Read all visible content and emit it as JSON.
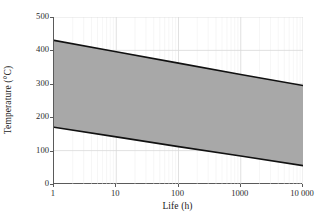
{
  "chart_data": {
    "type": "area",
    "title": "",
    "xlabel": "Life (h)",
    "ylabel": "Temperature (°C)",
    "xscale": "log",
    "xlim": [
      1,
      10000
    ],
    "ylim": [
      0,
      500
    ],
    "xticks": [
      1,
      10,
      100,
      1000,
      10000
    ],
    "xticklabels": [
      "1",
      "10",
      "100",
      "1000",
      "10 000"
    ],
    "yticks": [
      0,
      100,
      200,
      300,
      400,
      500
    ],
    "yticklabels": [
      "0",
      "100",
      "200",
      "300",
      "400",
      "500"
    ],
    "grid": true,
    "grid_color": "#d9d9d9",
    "legend": null,
    "band_fill_color": "#a8a8a8",
    "band_line_color": "#111111",
    "series": [
      {
        "name": "Upper bound",
        "x": [
          1,
          10,
          100,
          1000,
          10000
        ],
        "values": [
          430,
          396,
          362,
          328,
          295
        ]
      },
      {
        "name": "Lower bound",
        "x": [
          1,
          10,
          100,
          1000,
          10000
        ],
        "values": [
          170,
          141,
          112,
          84,
          55
        ]
      }
    ]
  },
  "axes": {
    "y_title": "Temperature (°C)",
    "x_title": "Life (h)"
  },
  "xticklabels": [
    "1",
    "10",
    "100",
    "1000",
    "10 000"
  ],
  "yticklabels": [
    "0",
    "100",
    "200",
    "300",
    "400",
    "500"
  ]
}
